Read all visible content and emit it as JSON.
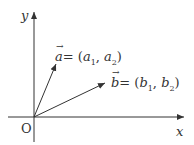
{
  "diagram": {
    "axes": {
      "x_label": "x",
      "y_label": "y",
      "origin_label": "O"
    },
    "vectors": [
      {
        "name": "a",
        "label": "a",
        "eq": "= (",
        "c1": "a",
        "s1": "1",
        "sep": ",  ",
        "c2": "a",
        "s2": "2",
        "close": ")"
      },
      {
        "name": "b",
        "label": "b",
        "eq": "= (",
        "c1": "b",
        "s1": "1",
        "sep": ",  ",
        "c2": "b",
        "s2": "2",
        "close": ")"
      }
    ],
    "colors": {
      "line": "#333333"
    }
  }
}
